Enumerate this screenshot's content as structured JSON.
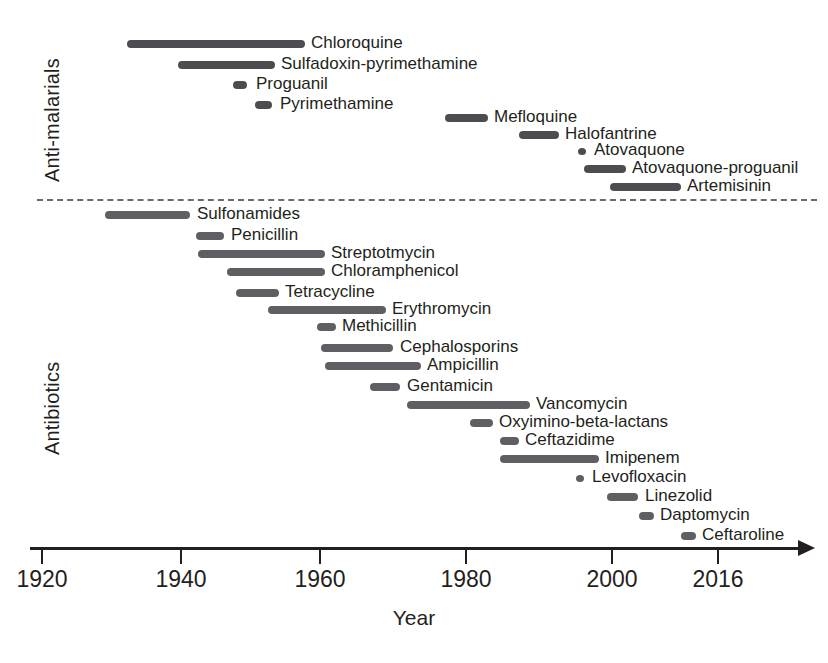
{
  "figure": {
    "axis_title": "Year",
    "sections": [
      {
        "key": "antimalarials",
        "label": "Anti-malarials"
      },
      {
        "key": "antibiotics",
        "label": "Antibiotics"
      }
    ]
  },
  "chart_data": {
    "type": "bar",
    "title": "",
    "subtitle": "",
    "xlabel": "Year",
    "ylabel": "",
    "xlim": [
      1920,
      2020
    ],
    "grid": false,
    "legend": null,
    "orientation": "horizontal-timeline",
    "axis_ticks": [
      {
        "label": "1920",
        "value": 1920,
        "x": 41
      },
      {
        "label": "1940",
        "value": 1940,
        "x": 180
      },
      {
        "label": "1960",
        "value": 1960,
        "x": 319
      },
      {
        "label": "1980",
        "value": 1980,
        "x": 465
      },
      {
        "label": "2000",
        "value": 2000,
        "x": 611
      },
      {
        "label": "2016",
        "value": 2016,
        "x": 717
      }
    ],
    "groups": [
      {
        "name": "Anti-malarials",
        "color": "#4d4d51",
        "items": [
          {
            "name": "Chloroquine",
            "start": 1932,
            "end": 1957,
            "row": 0,
            "x0": 127,
            "x1": 305,
            "label_x": 311,
            "y": 36
          },
          {
            "name": "Sulfadoxin-pyrimethamine",
            "start": 1939,
            "end": 1952,
            "row": 1,
            "x0": 178,
            "x1": 275,
            "label_x": 281,
            "y": 57
          },
          {
            "name": "Proguanil",
            "start": 1947,
            "end": 1949,
            "row": 2,
            "x0": 233,
            "x1": 247,
            "label_x": 256,
            "y": 77
          },
          {
            "name": "Pyrimethamine",
            "start": 1950,
            "end": 1953,
            "row": 3,
            "x0": 255,
            "x1": 272,
            "label_x": 280,
            "y": 97
          },
          {
            "name": "Mefloquine",
            "start": 1977,
            "end": 1983,
            "row": 4,
            "x0": 445,
            "x1": 488,
            "label_x": 494,
            "y": 110
          },
          {
            "name": "Halofantrine",
            "start": 1987,
            "end": 1993,
            "row": 5,
            "x0": 519,
            "x1": 559,
            "label_x": 565,
            "y": 127
          },
          {
            "name": "Atovaquone",
            "start": 1996,
            "end": 1997,
            "row": 6,
            "x0": 578,
            "x1": 586,
            "label_x": 594,
            "y": 143,
            "is_dot": true
          },
          {
            "name": "Atovaquone-proguanil",
            "start": 1997,
            "end": 2003,
            "row": 7,
            "x0": 584,
            "x1": 626,
            "label_x": 632,
            "y": 161
          },
          {
            "name": "Artemisinin",
            "start": 2000,
            "end": 2010,
            "row": 8,
            "x0": 610,
            "x1": 681,
            "label_x": 687,
            "y": 179
          }
        ]
      },
      {
        "name": "Antibiotics",
        "color": "#5f5f63",
        "items": [
          {
            "name": "Sulfonamides",
            "start": 1929,
            "end": 1940,
            "row": 0,
            "x0": 105,
            "x1": 190,
            "label_x": 197,
            "y": 207
          },
          {
            "name": "Penicillin",
            "start": 1942,
            "end": 1946,
            "row": 1,
            "x0": 196,
            "x1": 224,
            "label_x": 231,
            "y": 228
          },
          {
            "name": "Streptotmycin",
            "start": 1942,
            "end": 1960,
            "row": 2,
            "x0": 198,
            "x1": 325,
            "label_x": 331,
            "y": 246
          },
          {
            "name": "Chloramphenicol",
            "start": 1946,
            "end": 1960,
            "row": 3,
            "x0": 227,
            "x1": 325,
            "label_x": 331,
            "y": 264
          },
          {
            "name": "Tetracycline",
            "start": 1947,
            "end": 1953,
            "row": 4,
            "x0": 236,
            "x1": 279,
            "label_x": 285,
            "y": 285
          },
          {
            "name": "Erythromycin",
            "start": 1952,
            "end": 1968,
            "row": 5,
            "x0": 268,
            "x1": 386,
            "label_x": 392,
            "y": 302
          },
          {
            "name": "Methicillin",
            "start": 1959,
            "end": 1962,
            "row": 6,
            "x0": 317,
            "x1": 336,
            "label_x": 342,
            "y": 319
          },
          {
            "name": "Cephalosporins",
            "start": 1959,
            "end": 1969,
            "row": 7,
            "x0": 321,
            "x1": 393,
            "label_x": 400,
            "y": 340
          },
          {
            "name": "Ampicillin",
            "start": 1960,
            "end": 1973,
            "row": 8,
            "x0": 325,
            "x1": 421,
            "label_x": 427,
            "y": 358
          },
          {
            "name": "Gentamicin",
            "start": 1966,
            "end": 1970,
            "row": 9,
            "x0": 370,
            "x1": 400,
            "label_x": 407,
            "y": 379
          },
          {
            "name": "Vancomycin",
            "start": 1971,
            "end": 1988,
            "row": 10,
            "x0": 407,
            "x1": 530,
            "label_x": 536,
            "y": 397
          },
          {
            "name": "Oxyimino-beta-lactans",
            "start": 1980,
            "end": 1983,
            "row": 11,
            "x0": 470,
            "x1": 493,
            "label_x": 499,
            "y": 415
          },
          {
            "name": "Ceftazidime",
            "start": 1984,
            "end": 1987,
            "row": 12,
            "x0": 500,
            "x1": 519,
            "label_x": 525,
            "y": 433
          },
          {
            "name": "Imipenem",
            "start": 1984,
            "end": 1997,
            "row": 13,
            "x0": 500,
            "x1": 599,
            "label_x": 605,
            "y": 451
          },
          {
            "name": "Levofloxacin",
            "start": 1996,
            "end": 1997,
            "row": 14,
            "x0": 576,
            "x1": 584,
            "label_x": 592,
            "y": 470,
            "is_dot": true
          },
          {
            "name": "Linezolid",
            "start": 2000,
            "end": 2004,
            "row": 15,
            "x0": 607,
            "x1": 638,
            "label_x": 645,
            "y": 489
          },
          {
            "name": "Daptomycin",
            "start": 2004,
            "end": 2006,
            "row": 16,
            "x0": 639,
            "x1": 654,
            "label_x": 660,
            "y": 508
          },
          {
            "name": "Ceftaroline",
            "start": 2010,
            "end": 2012,
            "row": 17,
            "x0": 681,
            "x1": 696,
            "label_x": 702,
            "y": 528
          }
        ]
      }
    ]
  }
}
